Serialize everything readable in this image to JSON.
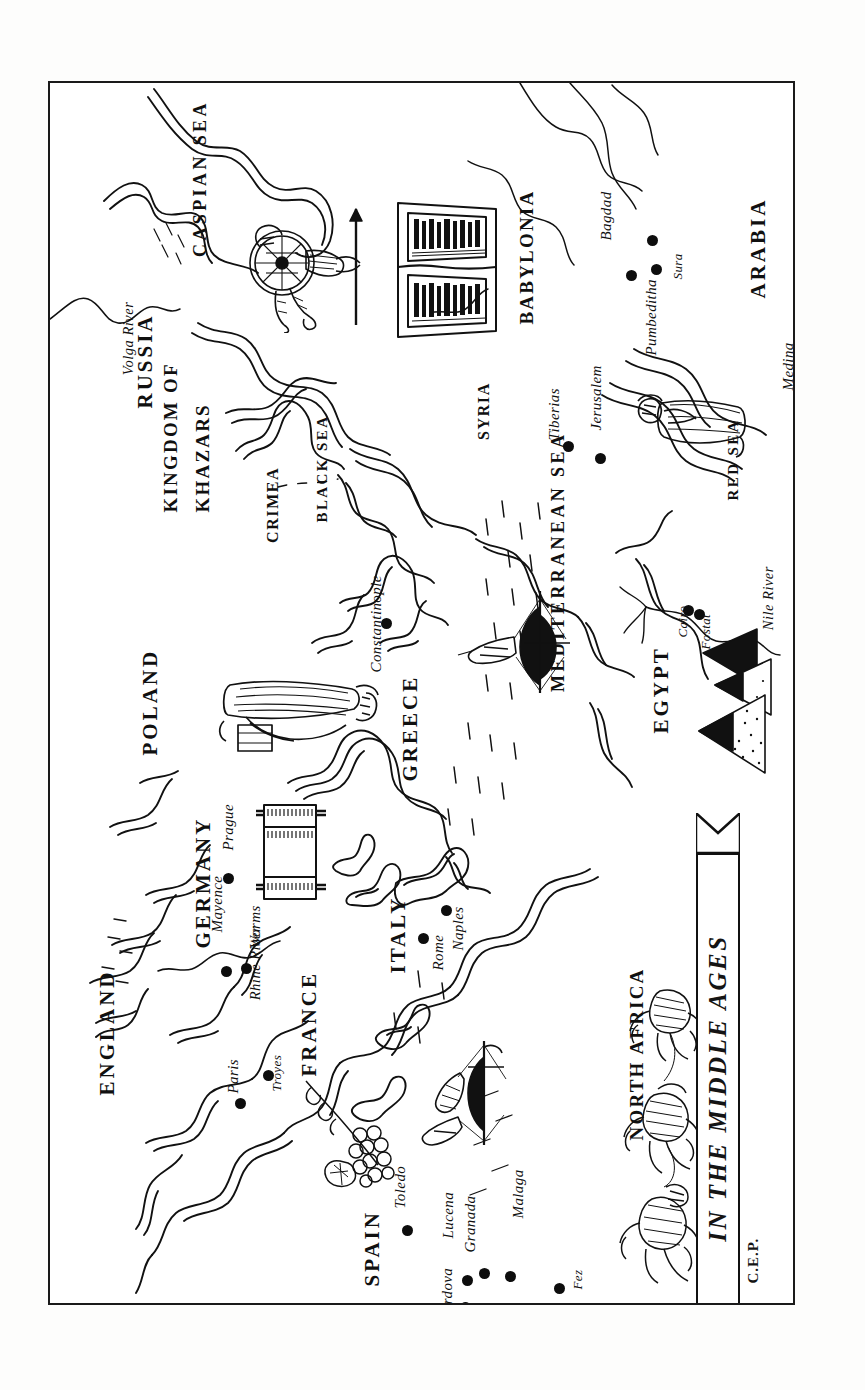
{
  "document": {
    "kind": "pen-and-ink historical map illustration",
    "title": "IN THE MIDDLE AGES",
    "signature": "C.E.P.",
    "orientation": "landscape map rotated 90 degrees clockwise within a portrait frame",
    "ink_color": "#111111",
    "paper_color": "#ffffff"
  },
  "regions": [
    {
      "name": "RUSSIA",
      "x": 95,
      "y": 315
    },
    {
      "name": "KINGDOM OF",
      "x": 120,
      "y": 420
    },
    {
      "name": "KHAZARS",
      "x": 152,
      "y": 420
    },
    {
      "name": "CRIMEA",
      "x": 223,
      "y": 452
    },
    {
      "name": "POLAND",
      "x": 100,
      "y": 662
    },
    {
      "name": "GERMANY",
      "x": 153,
      "y": 855
    },
    {
      "name": "ENGLAND",
      "x": 57,
      "y": 1002
    },
    {
      "name": "FRANCE",
      "x": 259,
      "y": 983
    },
    {
      "name": "SPAIN",
      "x": 322,
      "y": 1193
    },
    {
      "name": "ITALY",
      "x": 348,
      "y": 880
    },
    {
      "name": "GREECE",
      "x": 360,
      "y": 688
    },
    {
      "name": "NORTH AFRICA",
      "x": 586,
      "y": 1048
    },
    {
      "name": "EGYPT",
      "x": 611,
      "y": 640
    },
    {
      "name": "BABYLONIA",
      "x": 476,
      "y": 232
    },
    {
      "name": "ARABIA",
      "x": 708,
      "y": 205
    },
    {
      "name": "SYRIA",
      "x": 434,
      "y": 349
    }
  ],
  "seas": [
    {
      "name": "CASPIAN SEA",
      "x": 150,
      "y": 165
    },
    {
      "name": "BLACK SEA",
      "x": 272,
      "y": 432
    },
    {
      "name": "MEDITERRANEAN SEA",
      "x": 508,
      "y": 600
    },
    {
      "name": "RED SEA",
      "x": 683,
      "y": 410
    }
  ],
  "rivers": [
    {
      "name": "Volga River",
      "x": 78,
      "y": 285
    },
    {
      "name": "Rhine River",
      "x": 205,
      "y": 910
    },
    {
      "name": "Nile River",
      "x": 718,
      "y": 540
    }
  ],
  "cities": [
    {
      "name": "Bagdad",
      "x": 602,
      "y": 157,
      "label_x": 556,
      "label_y": 150
    },
    {
      "name": "Sura",
      "x": 606,
      "y": 186,
      "label_x": 627,
      "label_y": 190
    },
    {
      "name": "Pumbeditha",
      "x": 581,
      "y": 192,
      "label_x": 601,
      "label_y": 265
    },
    {
      "name": "Medina",
      "x": 766,
      "y": 282,
      "label_x": 738,
      "label_y": 300
    },
    {
      "name": "Jerusalem",
      "x": 550,
      "y": 375,
      "label_x": 546,
      "label_y": 340
    },
    {
      "name": "Tiberias",
      "x": 518,
      "y": 363,
      "label_x": 504,
      "label_y": 350
    },
    {
      "name": "Cairo",
      "x": 638,
      "y": 527,
      "label_x": 632,
      "label_y": 548
    },
    {
      "name": "Fostat",
      "x": 649,
      "y": 531,
      "label_x": 655,
      "label_y": 560
    },
    {
      "name": "Constantinople",
      "x": 336,
      "y": 540,
      "label_x": 326,
      "label_y": 582
    },
    {
      "name": "Prague",
      "x": 178,
      "y": 795,
      "label_x": 178,
      "label_y": 760
    },
    {
      "name": "Mayence",
      "x": 176,
      "y": 888,
      "label_x": 167,
      "label_y": 842
    },
    {
      "name": "Worms",
      "x": 196,
      "y": 885,
      "label_x": 205,
      "label_y": 858
    },
    {
      "name": "Rome",
      "x": 396,
      "y": 827,
      "label_x": 388,
      "label_y": 880
    },
    {
      "name": "Naples",
      "x": 373,
      "y": 855,
      "label_x": 408,
      "label_y": 860
    },
    {
      "name": "Paris",
      "x": 190,
      "y": 1020,
      "label_x": 183,
      "label_y": 1003
    },
    {
      "name": "Troyes",
      "x": 218,
      "y": 992,
      "label_x": 226,
      "label_y": 1002
    },
    {
      "name": "Toledo",
      "x": 357,
      "y": 1147,
      "label_x": 350,
      "label_y": 1118
    },
    {
      "name": "Lucena",
      "x": 417,
      "y": 1197,
      "label_x": 398,
      "label_y": 1148
    },
    {
      "name": "Granada",
      "x": 434,
      "y": 1190,
      "label_x": 420,
      "label_y": 1162
    },
    {
      "name": "Cordova",
      "x": 415,
      "y": 1224,
      "label_x": 397,
      "label_y": 1232
    },
    {
      "name": "Malaga",
      "x": 460,
      "y": 1193,
      "label_x": 468,
      "label_y": 1128
    },
    {
      "name": "Fez",
      "x": 509,
      "y": 1205,
      "label_x": 527,
      "label_y": 1200
    }
  ],
  "title_banner": {
    "text": "IN THE MIDDLE AGES"
  },
  "illustrations": [
    {
      "id": "khazar-warrior",
      "desc": "Khazar warrior with round shield and spear",
      "x": 236,
      "y": 175
    },
    {
      "id": "open-talmud-book",
      "desc": "Open illuminated book (Talmud) over Babylonia",
      "x": 400,
      "y": 185
    },
    {
      "id": "torah-scroll",
      "desc": "Torah scroll with rollers, over Germany",
      "x": 232,
      "y": 770
    },
    {
      "id": "robed-scholar",
      "desc": "Robed scholar figure near Poland",
      "x": 250,
      "y": 628
    },
    {
      "id": "standing-figure",
      "desc": "Standing robed figure near Arabia",
      "x": 655,
      "y": 345
    },
    {
      "id": "galley-aegean",
      "desc": "Sailing galley in the Aegean Sea",
      "x": 468,
      "y": 555
    },
    {
      "id": "galley-spain",
      "desc": "Sailing ship off the coast of Spain",
      "x": 402,
      "y": 1010
    },
    {
      "id": "pyramids",
      "desc": "Pyramids of Egypt",
      "x": 700,
      "y": 620
    },
    {
      "id": "grapevine",
      "desc": "Grape cluster and vine in southern France",
      "x": 306,
      "y": 1060
    },
    {
      "id": "camel-caravan",
      "desc": "Camel caravan crossing North Africa",
      "x": 620,
      "y": 1050
    }
  ],
  "signature": {
    "text": "C.E.P."
  }
}
